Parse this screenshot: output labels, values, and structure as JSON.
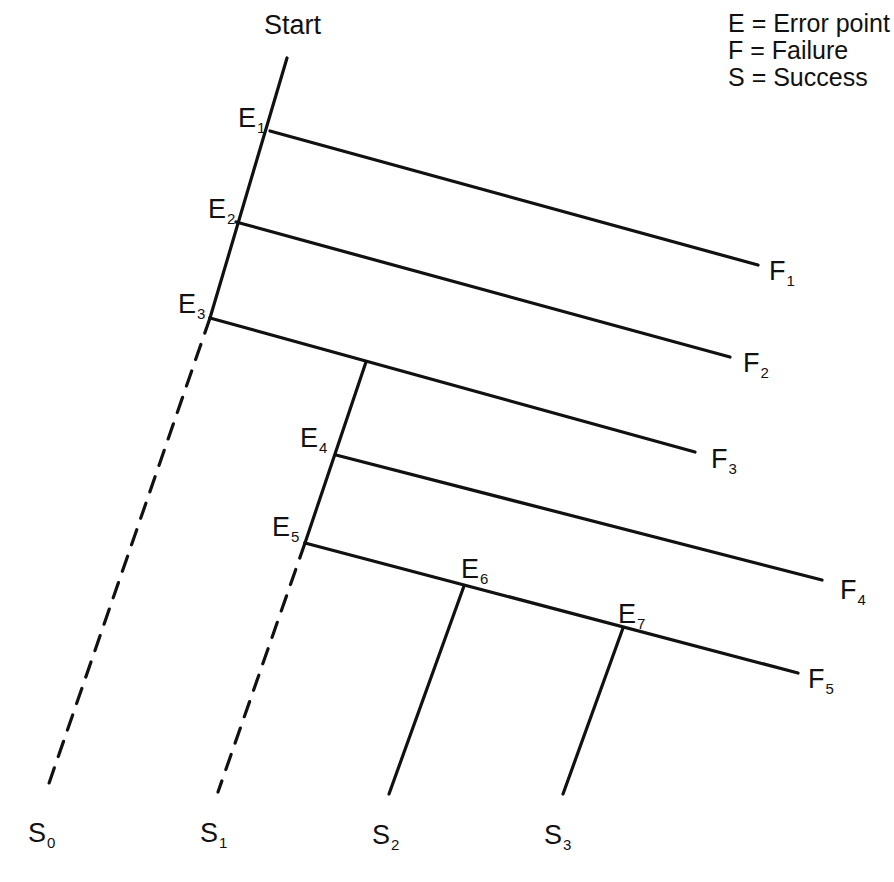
{
  "diagram": {
    "title": "Start",
    "legend": [
      {
        "key": "E",
        "sep": " = ",
        "meaning": "Error point"
      },
      {
        "key": "F",
        "sep": " = ",
        "meaning": "Failure"
      },
      {
        "key": "S",
        "sep": " = ",
        "meaning": "Success"
      }
    ],
    "error_points": [
      {
        "id": "E1",
        "letter": "E",
        "sub": "1"
      },
      {
        "id": "E2",
        "letter": "E",
        "sub": "2"
      },
      {
        "id": "E3",
        "letter": "E",
        "sub": "3"
      },
      {
        "id": "E4",
        "letter": "E",
        "sub": "4"
      },
      {
        "id": "E5",
        "letter": "E",
        "sub": "5"
      },
      {
        "id": "E6",
        "letter": "E",
        "sub": "6"
      },
      {
        "id": "E7",
        "letter": "E",
        "sub": "7"
      }
    ],
    "failures": [
      {
        "id": "F1",
        "letter": "F",
        "sub": "1",
        "from": "E1"
      },
      {
        "id": "F2",
        "letter": "F",
        "sub": "2",
        "from": "E2"
      },
      {
        "id": "F3",
        "letter": "F",
        "sub": "3",
        "from": "E3"
      },
      {
        "id": "F4",
        "letter": "F",
        "sub": "4",
        "from": "E4"
      },
      {
        "id": "F5",
        "letter": "F",
        "sub": "5",
        "from": "E5"
      }
    ],
    "successes": [
      {
        "id": "S0",
        "letter": "S",
        "sub": "0",
        "from": "E3",
        "style": "dashed"
      },
      {
        "id": "S1",
        "letter": "S",
        "sub": "1",
        "from": "E5",
        "style": "dashed"
      },
      {
        "id": "S2",
        "letter": "S",
        "sub": "2",
        "from": "E6",
        "style": "solid"
      },
      {
        "id": "S3",
        "letter": "S",
        "sub": "3",
        "from": "E7",
        "style": "solid"
      }
    ],
    "colors": {
      "line": "#111111",
      "background": "#ffffff"
    }
  }
}
